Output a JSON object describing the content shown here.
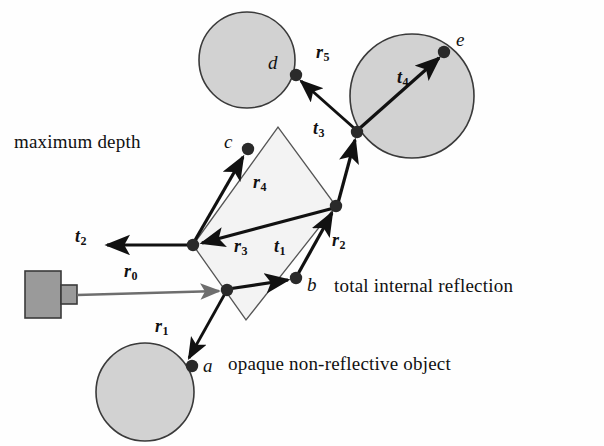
{
  "figure": {
    "background_color": "#fefefe",
    "ink_color": "#111111",
    "shape_fill": "#d2d2d2",
    "shape_stroke": "#3a3a3a",
    "glass_fill": "#f2f2f2",
    "camera_fill": "#9a9a9a",
    "primary_ray_color": "#6e6e6e"
  },
  "annotations": {
    "maximum_depth": "maximum depth",
    "total_internal_reflection": "total internal reflection",
    "opaque_object": "opaque non-reflective object"
  },
  "points": [
    {
      "id": "a",
      "label": "a",
      "x": 192,
      "y": 366,
      "label_x": 203,
      "label_y": 355
    },
    {
      "id": "b",
      "label": "b",
      "x": 296,
      "y": 278,
      "label_x": 307,
      "label_y": 276
    },
    {
      "id": "c",
      "label": "c",
      "x": 248,
      "y": 149,
      "label_x": 224,
      "label_y": 131
    },
    {
      "id": "d",
      "label": "d",
      "x": 296,
      "y": 75,
      "label_x": 269,
      "label_y": 54
    },
    {
      "id": "e",
      "label": "e",
      "x": 444,
      "y": 52,
      "label_x": 456,
      "label_y": 31
    }
  ],
  "vectors": [
    {
      "id": "r0",
      "letter": "r",
      "index": "0",
      "label_x": 125,
      "label_y": 270,
      "kind": "primary"
    },
    {
      "id": "r1",
      "letter": "r",
      "index": "1",
      "label_x": 156,
      "label_y": 322,
      "kind": "reflected"
    },
    {
      "id": "r2",
      "letter": "r",
      "index": "2",
      "label_x": 333,
      "label_y": 236,
      "kind": "reflected"
    },
    {
      "id": "r3",
      "letter": "r",
      "index": "3",
      "label_x": 236,
      "label_y": 242,
      "kind": "reflected"
    },
    {
      "id": "r4",
      "letter": "r",
      "index": "4",
      "label_x": 254,
      "label_y": 178,
      "kind": "reflected"
    },
    {
      "id": "r5",
      "letter": "r",
      "index": "5",
      "label_x": 317,
      "label_y": 48,
      "kind": "reflected"
    },
    {
      "id": "t1",
      "letter": "t",
      "index": "1",
      "label_x": 275,
      "label_y": 242,
      "kind": "transmitted"
    },
    {
      "id": "t2",
      "letter": "t",
      "index": "2",
      "label_x": 76,
      "label_y": 232,
      "kind": "transmitted"
    },
    {
      "id": "t3",
      "letter": "t",
      "index": "3",
      "label_x": 314,
      "label_y": 124,
      "kind": "transmitted"
    },
    {
      "id": "t4",
      "letter": "t",
      "index": "4",
      "label_x": 398,
      "label_y": 73,
      "kind": "transmitted"
    }
  ],
  "shapes": {
    "circle_opaque": {
      "cx": 145,
      "cy": 392,
      "r": 49
    },
    "circle_d": {
      "cx": 247,
      "cy": 60,
      "r": 48
    },
    "circle_e": {
      "cx": 412,
      "cy": 96,
      "r": 62
    },
    "glass_quad": "193,245 278,127 336,206 246,320",
    "camera_body": {
      "x": 25,
      "y": 271,
      "w": 36,
      "h": 47
    },
    "camera_lens": {
      "x": 61,
      "y": 285,
      "w": 16,
      "h": 19
    }
  }
}
